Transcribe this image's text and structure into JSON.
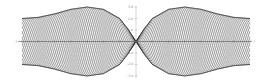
{
  "chart_data": {
    "type": "line",
    "title": "",
    "xlabel": "",
    "ylabel": "",
    "xlim": [
      -7,
      7
    ],
    "ylim": [
      -3.2,
      3.2
    ],
    "x_ticks": [
      -7,
      -6,
      -5,
      -4,
      -3,
      -2,
      -1,
      0,
      1,
      2,
      3,
      4,
      5,
      6,
      7
    ],
    "y_ticks": [
      -3.0,
      -2.0,
      -1.0,
      0,
      1.0,
      2.0,
      3.0
    ],
    "y_tick_labels": [
      "3.0",
      "2.0",
      "1.0",
      "-1.0",
      "-2.0",
      "-3.0"
    ],
    "envelope": {
      "x": [
        -7,
        -6,
        -5,
        -4,
        -3,
        -2,
        -1,
        -0.5,
        0,
        0.5,
        1,
        2,
        3,
        4,
        5,
        6,
        7
      ],
      "upper": [
        2.0,
        2.1,
        2.4,
        2.8,
        3.0,
        2.8,
        2.0,
        1.1,
        0,
        1.1,
        2.0,
        2.8,
        3.0,
        2.8,
        2.4,
        2.1,
        2.0
      ],
      "lower": [
        -2.0,
        -2.1,
        -2.4,
        -2.8,
        -3.0,
        -2.8,
        -2.0,
        -1.1,
        0,
        -1.1,
        -2.0,
        -2.8,
        -3.0,
        -2.8,
        -2.4,
        -2.1,
        -2.0
      ]
    },
    "series_count": 24,
    "line_color": "#1a1a1a",
    "grid": false,
    "legend": null
  },
  "axis_labels": {
    "x_left": "-7",
    "x_right": "7",
    "y_top": "3.0",
    "y_2": "2.0",
    "y_1": "1.0",
    "y_m1": "-1.0",
    "y_m2": "-2.0",
    "y_m3": "-3.0"
  }
}
